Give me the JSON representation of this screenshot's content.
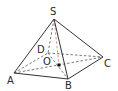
{
  "diagram": {
    "type": "pyramid",
    "vertices": {
      "S": {
        "label": "S",
        "x": 54,
        "y": 19,
        "lx": 50,
        "ly": 15
      },
      "A": {
        "label": "A",
        "x": 14,
        "y": 73,
        "lx": 7,
        "ly": 84
      },
      "B": {
        "label": "B",
        "x": 68,
        "y": 79,
        "lx": 65,
        "ly": 89
      },
      "C": {
        "label": "C",
        "x": 103,
        "y": 57,
        "lx": 104,
        "ly": 67
      },
      "D": {
        "label": "D",
        "x": 48,
        "y": 53,
        "lx": 37,
        "ly": 53
      },
      "O": {
        "label": "O",
        "x": 59,
        "y": 65,
        "lx": 43,
        "ly": 65
      }
    },
    "solid_edges": [
      [
        "S",
        "A"
      ],
      [
        "S",
        "B"
      ],
      [
        "S",
        "C"
      ],
      [
        "A",
        "B"
      ],
      [
        "B",
        "C"
      ]
    ],
    "dashed_edges": [
      [
        "S",
        "D"
      ],
      [
        "A",
        "D"
      ],
      [
        "D",
        "C"
      ],
      [
        "A",
        "C"
      ],
      [
        "D",
        "B"
      ]
    ],
    "height_segment": [
      "S",
      "O"
    ],
    "colors": {
      "edge": "#333333",
      "dashed": "#555555",
      "height": "#e08a80",
      "point": "#111111"
    }
  }
}
